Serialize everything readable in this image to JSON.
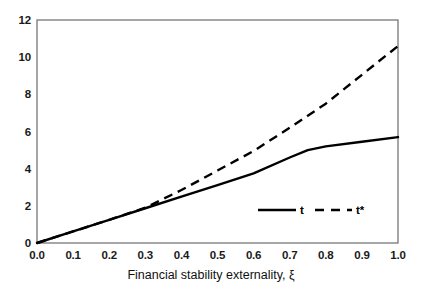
{
  "chart_data": {
    "type": "line",
    "title": "",
    "xlabel": "Financial stability externality, ξ",
    "ylabel": "",
    "xlim": [
      0.0,
      1.0
    ],
    "ylim": [
      0,
      12
    ],
    "grid": false,
    "legend_position": "inside-lower-right",
    "x": [
      0.0,
      0.1,
      0.2,
      0.3,
      0.4,
      0.5,
      0.6,
      0.7,
      0.75,
      0.8,
      0.9,
      1.0
    ],
    "series": [
      {
        "name": "t",
        "style": "solid",
        "color": "#000000",
        "values": [
          0.0,
          0.62,
          1.25,
          1.87,
          2.5,
          3.12,
          3.75,
          4.6,
          5.0,
          5.2,
          5.45,
          5.7
        ]
      },
      {
        "name": "t*",
        "style": "dashed",
        "color": "#000000",
        "values": [
          0.0,
          0.62,
          1.25,
          1.9,
          2.85,
          3.9,
          4.95,
          6.2,
          6.85,
          7.5,
          9.05,
          10.6
        ]
      }
    ],
    "xticks": [
      "0.0",
      "0.1",
      "0.2",
      "0.3",
      "0.4",
      "0.5",
      "0.6",
      "0.7",
      "0.8",
      "0.9",
      "1.0"
    ],
    "xtick_values": [
      0.0,
      0.1,
      0.2,
      0.3,
      0.4,
      0.5,
      0.6,
      0.7,
      0.8,
      0.9,
      1.0
    ],
    "yticks": [
      "0",
      "2",
      "4",
      "6",
      "8",
      "10",
      "12"
    ],
    "ytick_values": [
      0,
      2,
      4,
      6,
      8,
      10,
      12
    ],
    "legend": [
      {
        "label": "t",
        "style": "solid"
      },
      {
        "label": "t*",
        "style": "dashed"
      }
    ],
    "axis_color": "#6b6b6b",
    "line_color": "#000000",
    "background": "#ffffff"
  }
}
